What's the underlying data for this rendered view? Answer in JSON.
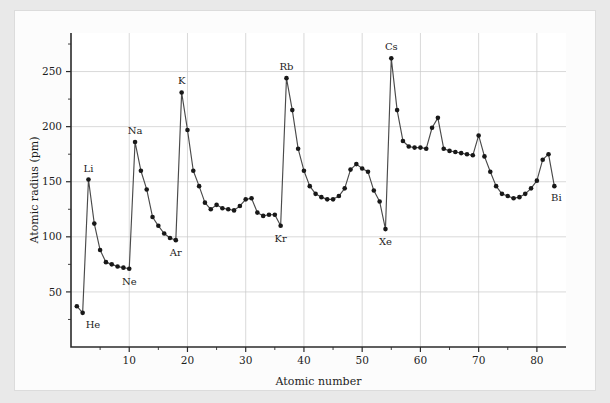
{
  "chart_data": {
    "type": "line",
    "title": "",
    "xlabel": "Atomic number",
    "ylabel": "Atomic radius (pm)",
    "xlim": [
      0,
      85
    ],
    "ylim": [
      0,
      285
    ],
    "grid": true,
    "legend": "none",
    "marker": "filled-circle",
    "line_color": "#4a4a4a",
    "marker_color": "#181818",
    "background_color": "#fcfcfc",
    "page_background_color": "#e9e9e9",
    "grid_color": "#c9c9c9",
    "axis_color": "#2b2b2b",
    "xticks": [
      10,
      20,
      30,
      40,
      50,
      60,
      70,
      80
    ],
    "xticklabels": [
      "10",
      "20",
      "30",
      "40",
      "50",
      "60",
      "70",
      "80"
    ],
    "xminorticks": [
      5,
      15,
      25,
      35,
      45,
      55,
      65,
      75
    ],
    "yticks": [
      50,
      100,
      150,
      200,
      250
    ],
    "yticklabels": [
      "50",
      "100",
      "150",
      "200",
      "250"
    ],
    "yminorticks": [
      25,
      75,
      125,
      175,
      225,
      275
    ],
    "x": [
      1,
      2,
      3,
      4,
      5,
      6,
      7,
      8,
      9,
      10,
      11,
      12,
      13,
      14,
      15,
      16,
      17,
      18,
      19,
      20,
      21,
      22,
      23,
      24,
      25,
      26,
      27,
      28,
      29,
      30,
      31,
      32,
      33,
      34,
      35,
      36,
      37,
      38,
      39,
      40,
      41,
      42,
      43,
      44,
      45,
      46,
      47,
      48,
      49,
      50,
      51,
      52,
      53,
      54,
      55,
      56,
      57,
      58,
      59,
      60,
      61,
      62,
      63,
      64,
      65,
      66,
      67,
      68,
      69,
      70,
      71,
      72,
      73,
      74,
      75,
      76,
      77,
      78,
      79,
      80,
      81,
      82,
      83
    ],
    "y": [
      37,
      31,
      152,
      112,
      88,
      77,
      75,
      73,
      72,
      71,
      186,
      160,
      143,
      118,
      110,
      103,
      99,
      97,
      231,
      197,
      160,
      146,
      131,
      125,
      129,
      126,
      125,
      124,
      128,
      134,
      135,
      122,
      119,
      120,
      120,
      110,
      244,
      215,
      180,
      160,
      146,
      139,
      136,
      134,
      134,
      137,
      144,
      161,
      166,
      162,
      159,
      142,
      132,
      107,
      262,
      215,
      187,
      182,
      181,
      181,
      180,
      199,
      208,
      180,
      178,
      177,
      176,
      175,
      174,
      192,
      173,
      159,
      146,
      139,
      137,
      135,
      136,
      139,
      144,
      151,
      170,
      175,
      146
    ],
    "point_labels": [
      {
        "element": "He",
        "atomic_number": 2,
        "radius": 31
      },
      {
        "element": "Li",
        "atomic_number": 3,
        "radius": 152
      },
      {
        "element": "Ne",
        "atomic_number": 10,
        "radius": 71
      },
      {
        "element": "Na",
        "atomic_number": 11,
        "radius": 186
      },
      {
        "element": "Ar",
        "atomic_number": 18,
        "radius": 97
      },
      {
        "element": "K",
        "atomic_number": 19,
        "radius": 231
      },
      {
        "element": "Kr",
        "atomic_number": 36,
        "radius": 110
      },
      {
        "element": "Rb",
        "atomic_number": 37,
        "radius": 244
      },
      {
        "element": "Xe",
        "atomic_number": 54,
        "radius": 107
      },
      {
        "element": "Cs",
        "atomic_number": 55,
        "radius": 262
      },
      {
        "element": "Bi",
        "atomic_number": 83,
        "radius": 146
      }
    ]
  },
  "labels": {
    "x_axis_title": "Atomic number",
    "y_axis_title": "Atomic radius (pm)"
  }
}
